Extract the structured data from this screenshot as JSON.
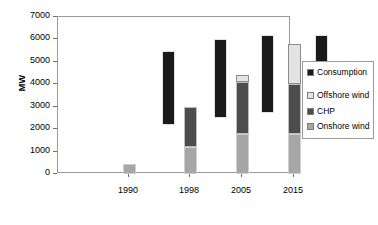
{
  "chart_data": {
    "type": "bar",
    "title": "",
    "subtitle": "",
    "xlabel": "",
    "ylabel": "MW",
    "ylim": [
      0,
      7000
    ],
    "yticks": [
      0,
      1000,
      2000,
      3000,
      4000,
      5000,
      6000,
      7000
    ],
    "ytick_labels": [
      "0",
      "1000",
      "2000",
      "3000",
      "4000",
      "5000",
      "6000",
      "7000"
    ],
    "grid": false,
    "legend_position": "right",
    "categories": [
      "1990",
      "1998",
      "2005",
      "2015"
    ],
    "legend": [
      {
        "label": "Consumption",
        "color": "#1a1a1a"
      },
      {
        "label": "Offshore wind",
        "color": "#e3e3e3"
      },
      {
        "label": "CHP",
        "color": "#4d4d4d"
      },
      {
        "label": "Onshore wind",
        "color": "#a6a6a6"
      }
    ],
    "series": [
      {
        "name": "Onshore wind",
        "values": [
          450,
          1200,
          1800,
          1800
        ]
      },
      {
        "name": "CHP",
        "values": [
          0,
          1800,
          2300,
          2200
        ]
      },
      {
        "name": "Offshore wind",
        "values": [
          0,
          0,
          300,
          1800
        ]
      }
    ],
    "consumption_bands": [
      {
        "category": "1998",
        "low": 2200,
        "high": 5500
      },
      {
        "category": "2005",
        "low": 2500,
        "high": 6000
      },
      {
        "category": "2005b",
        "low": 2700,
        "high": 6200
      },
      {
        "category": "2015",
        "low": 2800,
        "high": 6200
      }
    ],
    "bars": [
      {
        "group": "1990",
        "x": 71,
        "segments": [
          {
            "name": "Onshore wind",
            "from": 0,
            "to": 450
          }
        ]
      },
      {
        "group": "1998-consumption",
        "x": 110,
        "segments": [
          {
            "name": "Consumption",
            "from": 2200,
            "to": 5500
          }
        ]
      },
      {
        "group": "1998",
        "x": 132,
        "segments": [
          {
            "name": "Onshore wind",
            "from": 0,
            "to": 1200
          },
          {
            "name": "CHP",
            "from": 1200,
            "to": 3000
          }
        ]
      },
      {
        "group": "2005-consumption",
        "x": 162,
        "segments": [
          {
            "name": "Consumption",
            "from": 2500,
            "to": 6000
          }
        ]
      },
      {
        "group": "2005",
        "x": 184,
        "segments": [
          {
            "name": "Onshore wind",
            "from": 0,
            "to": 1800
          },
          {
            "name": "CHP",
            "from": 1800,
            "to": 4100
          },
          {
            "name": "Offshore wind",
            "from": 4100,
            "to": 4400
          }
        ]
      },
      {
        "group": "2005b-consumption",
        "x": 209,
        "segments": [
          {
            "name": "Consumption",
            "from": 2700,
            "to": 6200
          }
        ]
      },
      {
        "group": "2015",
        "x": 236,
        "segments": [
          {
            "name": "Onshore wind",
            "from": 0,
            "to": 1800
          },
          {
            "name": "CHP",
            "from": 1800,
            "to": 4000
          },
          {
            "name": "Offshore wind",
            "from": 4000,
            "to": 5800
          }
        ]
      },
      {
        "group": "2015-consumption",
        "x": 263,
        "segments": [
          {
            "name": "Consumption",
            "from": 2800,
            "to": 6200
          }
        ]
      }
    ],
    "xtick_positions": [
      71,
      132,
      184,
      236
    ]
  },
  "colors": {
    "consumption": "#1a1a1a",
    "offshore": "#e3e3e3",
    "chp": "#4d4d4d",
    "onshore": "#a6a6a6",
    "axis": "#6f6f6f",
    "frame": "#9a9a9a",
    "background": "#ffffff"
  }
}
